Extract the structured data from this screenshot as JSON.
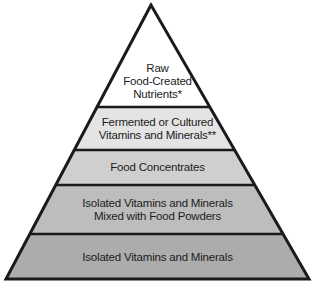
{
  "diagram": {
    "type": "pyramid",
    "levels": [
      {
        "id": "raw",
        "label": "Raw\nFood-Created\nNutrients*",
        "fill": "#ffffff"
      },
      {
        "id": "fermented",
        "label": "Fermented or Cultured\nVitamins and Minerals**",
        "fill": "#e4e4e4"
      },
      {
        "id": "concentrates",
        "label": "Food Concentrates",
        "fill": "#cfcfcf"
      },
      {
        "id": "mixed",
        "label": "Isolated Vitamins and Minerals\nMixed with Food Powders",
        "fill": "#bdbdbd"
      },
      {
        "id": "isolated",
        "label": "Isolated Vitamins and Minerals",
        "fill": "#acacac"
      }
    ],
    "outline_color": "#1a1a1a"
  }
}
